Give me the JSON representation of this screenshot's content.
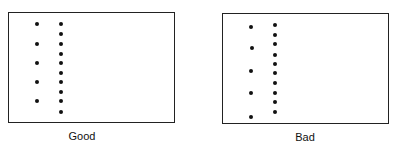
{
  "panels": [
    {
      "label": "Good",
      "box": {
        "x": 8,
        "y": 12,
        "w": 167,
        "h": 111
      },
      "label_pos": {
        "x": 82,
        "y": 130
      },
      "dots": [
        [
          37,
          24
        ],
        [
          37,
          44
        ],
        [
          37,
          63
        ],
        [
          37,
          82
        ],
        [
          37,
          101
        ],
        [
          61,
          24
        ],
        [
          61,
          34
        ],
        [
          61,
          44
        ],
        [
          61,
          54
        ],
        [
          61,
          63
        ],
        [
          61,
          73
        ],
        [
          61,
          82
        ],
        [
          61,
          92
        ],
        [
          61,
          101
        ],
        [
          61,
          112
        ]
      ]
    },
    {
      "label": "Bad",
      "box": {
        "x": 222,
        "y": 13,
        "w": 167,
        "h": 111
      },
      "label_pos": {
        "x": 305,
        "y": 131
      },
      "dots": [
        [
          251,
          27
        ],
        [
          252,
          48
        ],
        [
          251,
          71
        ],
        [
          251,
          93
        ],
        [
          251,
          117
        ],
        [
          275,
          25
        ],
        [
          275,
          35
        ],
        [
          275,
          44
        ],
        [
          275,
          55
        ],
        [
          275,
          64
        ],
        [
          275,
          73
        ],
        [
          275,
          83
        ],
        [
          275,
          93
        ],
        [
          275,
          102
        ],
        [
          275,
          112
        ]
      ]
    }
  ]
}
